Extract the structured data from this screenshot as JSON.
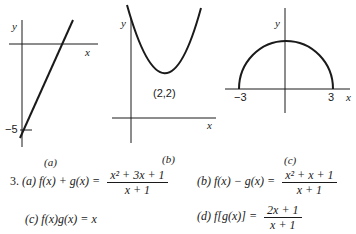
{
  "graphs": [
    {
      "id": "a",
      "caption": "(a)",
      "x_label": "x",
      "y_label": "y",
      "annotations": [
        "−5"
      ],
      "description": "line with y-intercept -5 and positive slope"
    },
    {
      "id": "b",
      "caption": "(b)",
      "x_label": "x",
      "y_label": "y",
      "annotations": [
        "(2,2)"
      ],
      "description": "upward parabola with vertex (2,2)"
    },
    {
      "id": "c",
      "caption": "(c)",
      "x_label": "x",
      "y_label": "y",
      "annotations": [
        "−3",
        "3"
      ],
      "description": "upper semicircle from -3 to 3"
    }
  ],
  "problem": {
    "number": "3.",
    "parts": [
      {
        "label": "(a)",
        "lhs": "f(x) + g(x) =",
        "numerator": "x² + 3x + 1",
        "denominator": "x + 1"
      },
      {
        "label": "(b)",
        "lhs": "f(x) − g(x) =",
        "numerator": "x² + x + 1",
        "denominator": "x + 1"
      },
      {
        "label": "(c)",
        "lhs": "f(x)g(x) = x"
      },
      {
        "label": "(d)",
        "lhs": "f[g(x)] =",
        "numerator": "2x + 1",
        "denominator": "x + 1"
      }
    ]
  }
}
